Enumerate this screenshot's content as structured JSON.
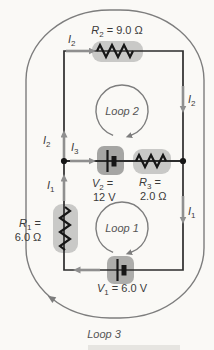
{
  "diagram": {
    "colors": {
      "background": "#faf9f6",
      "wire": "#2c2c2c",
      "component": "#161616",
      "current_arrow": "#8f8f8f",
      "loop_stroke": "#7d7d7d",
      "resistor_highlight": "#c9c9c7",
      "battery_v2_highlight": "#a5a5a3",
      "battery_v1_highlight": "#adadab",
      "text": "#3a3a3a"
    },
    "labels": {
      "r2": {
        "var": "R",
        "sub": "2",
        "rest": " = 9.0 Ω"
      },
      "r1": {
        "var": "R",
        "sub": "1",
        "rest": " =",
        "value": "6.0 Ω"
      },
      "r3": {
        "var": "R",
        "sub": "3",
        "rest": " =",
        "value": "2.0 Ω"
      },
      "v2": {
        "var": "V",
        "sub": "2",
        "rest": " =",
        "value": "12 V"
      },
      "v1": {
        "var": "V",
        "sub": "1",
        "rest": " = 6.0 V"
      },
      "i1": {
        "var": "I",
        "sub": "1"
      },
      "i2": {
        "var": "I",
        "sub": "2"
      },
      "i3": {
        "var": "I",
        "sub": "3"
      },
      "loop1": "Loop 1",
      "loop2": "Loop 2",
      "loop3": "Loop 3"
    }
  }
}
